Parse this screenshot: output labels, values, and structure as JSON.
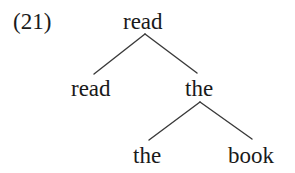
{
  "example": {
    "number": "(21)"
  },
  "tree": {
    "root": {
      "label": "read"
    },
    "level1": {
      "left": {
        "label": "read"
      },
      "right": {
        "label": "the"
      }
    },
    "level2": {
      "left": {
        "label": "the"
      },
      "right": {
        "label": "book"
      }
    }
  },
  "colors": {
    "text": "#1a1a1a",
    "edge": "#3a3a3a",
    "background": "#ffffff"
  }
}
